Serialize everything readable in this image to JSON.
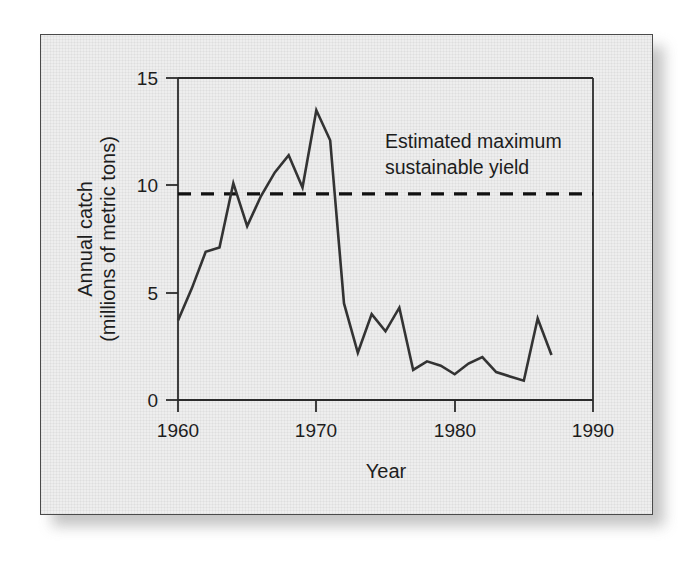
{
  "figure": {
    "background_color": "#ffffff",
    "plate_color": "#eeeeee",
    "plate_border_color": "#4a4a4a",
    "line_color": "#333333",
    "msy_color": "#111111"
  },
  "chart_data": {
    "type": "line",
    "title": "",
    "xlabel": "Year",
    "ylabel_line1": "Annual catch",
    "ylabel_line2": "(millions of metric tons)",
    "xlim": [
      1960,
      1990
    ],
    "ylim": [
      0,
      15
    ],
    "xticks": [
      1960,
      1970,
      1980,
      1990
    ],
    "xtick_labels": [
      "1960",
      "1970",
      "1980",
      "1990"
    ],
    "yticks": [
      0,
      5,
      10,
      15
    ],
    "ytick_labels": [
      "0",
      "5",
      "10",
      "15"
    ],
    "grid": false,
    "legend": "none",
    "series": [
      {
        "name": "Annual catch",
        "x": [
          1960,
          1961,
          1962,
          1963,
          1964,
          1965,
          1966,
          1967,
          1968,
          1969,
          1970,
          1971,
          1972,
          1973,
          1974,
          1975,
          1976,
          1977,
          1978,
          1979,
          1980,
          1981,
          1982,
          1983,
          1984,
          1985,
          1986,
          1987
        ],
        "values": [
          3.7,
          5.2,
          6.9,
          7.1,
          10.1,
          8.1,
          9.5,
          10.6,
          11.4,
          9.9,
          13.5,
          12.1,
          4.5,
          2.2,
          4.0,
          3.2,
          4.3,
          1.4,
          1.8,
          1.6,
          1.2,
          1.7,
          2.0,
          1.3,
          1.1,
          0.9,
          3.8,
          2.1
        ]
      }
    ],
    "annotations": [
      {
        "name": "msy-reference-line",
        "kind": "horizontal-dashed-line",
        "value": 9.6,
        "label_line1": "Estimated maximum",
        "label_line2": "sustainable yield"
      }
    ]
  }
}
